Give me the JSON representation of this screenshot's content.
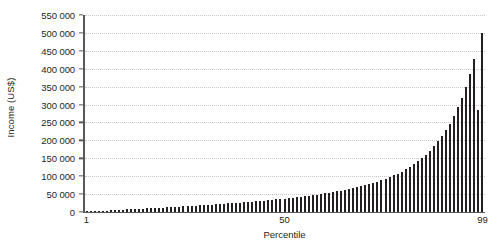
{
  "chart_data": {
    "type": "bar",
    "title": "",
    "subtitle": "",
    "xlabel": "Percentile",
    "ylabel": "Income (US$)",
    "xlim": [
      1,
      99
    ],
    "ylim": [
      0,
      550000
    ],
    "grid": true,
    "legend": false,
    "legend_position": "none",
    "bar_color": "#231f20",
    "gridline_color": "#c8c8c8",
    "axis_color": "#58595b",
    "y_ticks": [
      0,
      50000,
      100000,
      150000,
      200000,
      250000,
      300000,
      350000,
      400000,
      450000,
      500000,
      550000
    ],
    "y_tick_labels": [
      "0",
      "50 000",
      "100 000",
      "150 000",
      "200 000",
      "250 000",
      "300 000",
      "350 000",
      "400 000",
      "450 000",
      "500 000",
      "550 000"
    ],
    "x_ticks": [
      1,
      50,
      99
    ],
    "x_tick_labels": [
      "1",
      "50",
      "99"
    ],
    "categories": [
      1,
      2,
      3,
      4,
      5,
      6,
      7,
      8,
      9,
      10,
      11,
      12,
      13,
      14,
      15,
      16,
      17,
      18,
      19,
      20,
      21,
      22,
      23,
      24,
      25,
      26,
      27,
      28,
      29,
      30,
      31,
      32,
      33,
      34,
      35,
      36,
      37,
      38,
      39,
      40,
      41,
      42,
      43,
      44,
      45,
      46,
      47,
      48,
      49,
      50,
      51,
      52,
      53,
      54,
      55,
      56,
      57,
      58,
      59,
      60,
      61,
      62,
      63,
      64,
      65,
      66,
      67,
      68,
      69,
      70,
      71,
      72,
      73,
      74,
      75,
      76,
      77,
      78,
      79,
      80,
      81,
      82,
      83,
      84,
      85,
      86,
      87,
      88,
      89,
      90,
      91,
      92,
      93,
      94,
      95,
      96,
      97,
      98,
      99
    ],
    "values": [
      1200,
      1800,
      2400,
      3000,
      3600,
      4200,
      4800,
      5400,
      6000,
      6600,
      7200,
      7800,
      8400,
      9000,
      9600,
      10200,
      10800,
      11400,
      12000,
      12600,
      13200,
      13800,
      14400,
      15100,
      15800,
      16500,
      17200,
      17900,
      18600,
      19300,
      20000,
      20800,
      21600,
      22400,
      23200,
      24000,
      24800,
      25600,
      26400,
      27300,
      28200,
      29100,
      30000,
      31000,
      32000,
      33000,
      34000,
      35000,
      36200,
      37400,
      38600,
      39900,
      41200,
      42600,
      44000,
      45500,
      47000,
      48600,
      50300,
      52000,
      53900,
      55800,
      57800,
      59900,
      62100,
      64400,
      66800,
      69400,
      72100,
      75000,
      78100,
      81400,
      84900,
      88700,
      92800,
      97200,
      102000,
      107200,
      112900,
      119100,
      125900,
      133400,
      141600,
      150600,
      160500,
      171400,
      183500,
      196900,
      211800,
      228400,
      247000,
      268000,
      291800,
      318900,
      350000,
      385800,
      427500,
      285000,
      500000
    ],
    "units": "US$"
  },
  "axes": {
    "y_title": "Income (US$)",
    "x_title": "Percentile"
  }
}
